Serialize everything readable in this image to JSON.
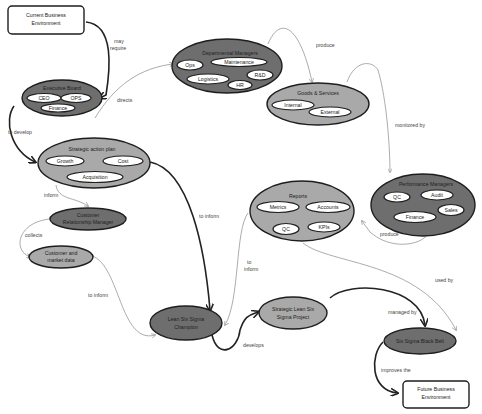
{
  "colors": {
    "dark_fill": "#6e6e6e",
    "mid_fill": "#a9a9a9",
    "white": "#ffffff",
    "stroke": "#1e1e1e",
    "thin_edge": "#8a8a8a"
  },
  "nodes": {
    "current_env": {
      "line1": "Current Business",
      "line2": "Environment"
    },
    "exec_board": {
      "title": "Executive Board",
      "items": [
        "CEO",
        "OPS",
        "Finance"
      ]
    },
    "dept_managers": {
      "title": "Departmental Managers",
      "items": [
        "Ops",
        "Maintenance",
        "Logistics",
        "R&D",
        "HR"
      ]
    },
    "goods_services": {
      "title": "Goods & Services",
      "items": [
        "Internal",
        "External"
      ]
    },
    "strategic_plan": {
      "title": "Strategic action plan",
      "items": [
        "Growth",
        "Cost",
        "Acquisition"
      ]
    },
    "crm": {
      "line1": "Customer",
      "line2": "Relationship Manager"
    },
    "market_data": {
      "line1": "Customer and",
      "line2": "market data"
    },
    "reports": {
      "title": "Reports",
      "items": [
        "Metrics",
        "Accounts",
        "QC",
        "KPIs"
      ]
    },
    "perf_managers": {
      "title": "Performance Managers",
      "items": [
        "QC",
        "Audit",
        "Sales",
        "Finance"
      ]
    },
    "champion": {
      "line1": "Lean Six Sigma",
      "line2": "Champion"
    },
    "strategic_project": {
      "line1": "Strategic Lean Six",
      "line2": "Sigma Project"
    },
    "black_belt": {
      "title": "Six Sigma Black Belt"
    },
    "future_env": {
      "line1": "Future Business",
      "line2": "Environment"
    }
  },
  "edges": {
    "may_require": {
      "line1": "may",
      "line2": "require"
    },
    "directs": "directs",
    "produce_top": "produce",
    "to_develop": "to develop",
    "monitored_by": "monitored by",
    "inform": "inform",
    "to_inform_center": "to inform",
    "collects": "collects",
    "to_inform_reports": {
      "line1": "to",
      "line2": "inform"
    },
    "produce_bottom": "produce",
    "to_inform_market": "to inform",
    "used_by": "used by",
    "develops": "develops",
    "managed_by": "managed by",
    "improves_the": "improves the"
  }
}
